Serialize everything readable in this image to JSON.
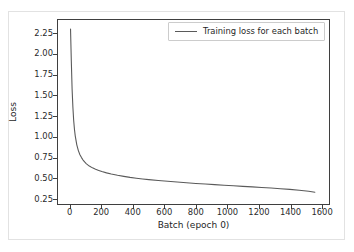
{
  "chart_data": {
    "type": "line",
    "title": "",
    "xlabel": "Batch (epoch 0)",
    "ylabel": "Loss",
    "xlim": [
      -80,
      1650
    ],
    "ylim": [
      0.18,
      2.42
    ],
    "grid": false,
    "legend_position": "upper right",
    "xticks": [
      0,
      200,
      400,
      600,
      800,
      1000,
      1200,
      1400,
      1600
    ],
    "xtick_labels": [
      "0",
      "200",
      "400",
      "600",
      "800",
      "1000",
      "1200",
      "1400",
      "1600"
    ],
    "yticks": [
      0.25,
      0.5,
      0.75,
      1.0,
      1.25,
      1.5,
      1.75,
      2.0,
      2.25
    ],
    "ytick_labels": [
      "0.25",
      "0.50",
      "0.75",
      "1.00",
      "1.25",
      "1.50",
      "1.75",
      "2.00",
      "2.25"
    ],
    "series": [
      {
        "name": "Training loss for each batch",
        "color": "#5a5a5a",
        "linewidth": 1.1,
        "x": [
          0,
          5,
          10,
          15,
          20,
          25,
          30,
          40,
          50,
          60,
          70,
          80,
          90,
          100,
          120,
          140,
          160,
          180,
          200,
          230,
          260,
          300,
          340,
          380,
          420,
          460,
          500,
          560,
          620,
          680,
          740,
          800,
          860,
          920,
          980,
          1040,
          1100,
          1160,
          1220,
          1280,
          1340,
          1400,
          1460,
          1520,
          1560
        ],
        "y": [
          2.31,
          1.92,
          1.58,
          1.36,
          1.2,
          1.09,
          1.01,
          0.9,
          0.83,
          0.78,
          0.745,
          0.715,
          0.692,
          0.672,
          0.642,
          0.62,
          0.603,
          0.589,
          0.576,
          0.559,
          0.545,
          0.529,
          0.516,
          0.504,
          0.494,
          0.485,
          0.477,
          0.466,
          0.456,
          0.447,
          0.438,
          0.43,
          0.423,
          0.416,
          0.409,
          0.402,
          0.395,
          0.388,
          0.381,
          0.374,
          0.366,
          0.358,
          0.348,
          0.335,
          0.323
        ]
      }
    ]
  },
  "legend": {
    "entries": [
      {
        "label": "Training loss for each batch"
      }
    ]
  },
  "axes": {
    "xlabel": "Batch (epoch 0)",
    "ylabel": "Loss"
  }
}
